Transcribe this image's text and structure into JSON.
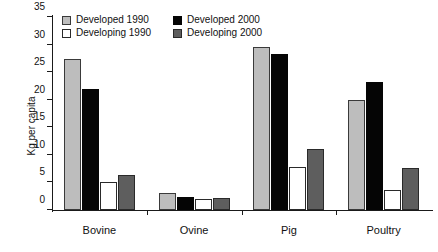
{
  "chart_data": {
    "type": "bar",
    "title": "",
    "xlabel": "",
    "ylabel": "Kg per capita",
    "ylim": [
      0,
      35
    ],
    "ytick_values": [
      0,
      5,
      10,
      15,
      20,
      25,
      30,
      35
    ],
    "ytick_labels": [
      "0",
      "5",
      "10",
      "15",
      "20",
      "25",
      "30",
      "35"
    ],
    "grid": false,
    "legend_position": "top-left",
    "categories": [
      "Bovine",
      "Ovine",
      "Pig",
      "Poultry"
    ],
    "series": [
      {
        "name": "Developed 1990",
        "color": "#bdbdbd",
        "values": [
          27.4,
          3.0,
          29.5,
          19.9
        ]
      },
      {
        "name": "Developed 2000",
        "color": "#050505",
        "values": [
          22.0,
          2.4,
          28.3,
          23.3
        ]
      },
      {
        "name": "Developing 1990",
        "color": "#ffffff",
        "values": [
          5.0,
          2.0,
          7.8,
          3.7
        ]
      },
      {
        "name": "Developing 2000",
        "color": "#5e5e5e",
        "values": [
          6.4,
          2.1,
          11.1,
          7.6
        ]
      }
    ]
  }
}
